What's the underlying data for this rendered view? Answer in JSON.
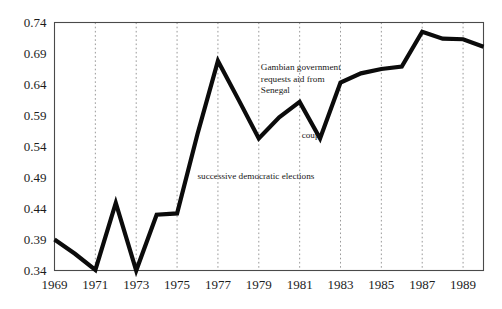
{
  "figure": {
    "background_color": "#ffffff",
    "frame_color": "#4a4a4a",
    "gridline_color": "#8d8d8d",
    "line_color": "#0b0b0b"
  },
  "chart_data": {
    "type": "line",
    "title": "",
    "subtitle": "",
    "xlabel": "",
    "ylabel": "",
    "xlim": [
      1969,
      1990
    ],
    "ylim": [
      0.34,
      0.74
    ],
    "grid": "vertical-dotted",
    "legend": "none",
    "x": [
      1969,
      1970,
      1971,
      1972,
      1973,
      1974,
      1975,
      1976,
      1977,
      1978,
      1979,
      1980,
      1981,
      1982,
      1983,
      1984,
      1985,
      1986,
      1987,
      1988,
      1989,
      1990
    ],
    "values": [
      0.39,
      0.367,
      0.341,
      0.449,
      0.34,
      0.43,
      0.432,
      0.56,
      0.678,
      0.616,
      0.553,
      0.587,
      0.612,
      0.553,
      0.643,
      0.658,
      0.665,
      0.669,
      0.725,
      0.714,
      0.713,
      0.701
    ],
    "series": [
      {
        "name": "index",
        "values": [
          0.39,
          0.367,
          0.341,
          0.449,
          0.34,
          0.43,
          0.432,
          0.56,
          0.678,
          0.616,
          0.553,
          0.587,
          0.612,
          0.553,
          0.643,
          0.658,
          0.665,
          0.669,
          0.725,
          0.714,
          0.713,
          0.701
        ]
      }
    ],
    "yticks": [
      0.34,
      0.39,
      0.44,
      0.49,
      0.54,
      0.59,
      0.64,
      0.69,
      0.74
    ],
    "ytick_labels": [
      "0.34",
      "0.39",
      "0.44",
      "0.49",
      "0.54",
      "0.59",
      "0.64",
      "0.69",
      "0.74"
    ],
    "xticks": [
      1969,
      1971,
      1973,
      1975,
      1977,
      1979,
      1981,
      1983,
      1985,
      1987,
      1989
    ],
    "xtick_labels": [
      "1969",
      "1971",
      "1973",
      "1975",
      "1977",
      "1979",
      "1981",
      "1983",
      "1985",
      "1987",
      "1989"
    ],
    "annotations": [
      {
        "id": "gambian-aid",
        "lines": [
          "Gambian government",
          "requests aid from",
          "Senegal"
        ],
        "x": 1979.1,
        "y": 0.663
      },
      {
        "id": "coup",
        "lines": [
          "coup"
        ],
        "x": 1981.1,
        "y": 0.554
      },
      {
        "id": "successive-elections",
        "lines": [
          "successive democratic elections"
        ],
        "x": 1976.0,
        "y": 0.487
      }
    ]
  }
}
